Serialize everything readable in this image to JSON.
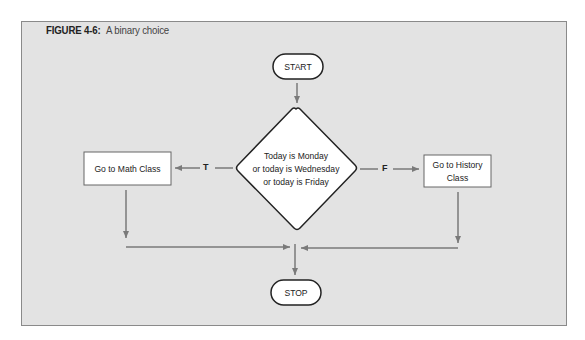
{
  "figure": {
    "label": "FIGURE 4-6:",
    "title": "A binary choice"
  },
  "nodes": {
    "start": "START",
    "decision_line1": "Today is Monday",
    "decision_line2": "or today is Wednesday",
    "decision_line3": "or today is Friday",
    "true_action": "Go to Math Class",
    "false_action_line1": "Go to History",
    "false_action_line2": "Class",
    "stop": "STOP"
  },
  "edges": {
    "true_label": "T",
    "false_label": "F"
  },
  "colors": {
    "panel_bg": "#e3e3e3",
    "arrow": "#7a7a7a",
    "node_fill": "#ffffff",
    "node_stroke": "#222222"
  }
}
